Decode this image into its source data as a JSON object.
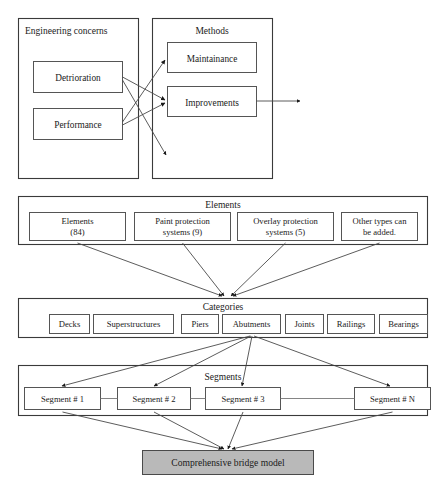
{
  "diagram": {
    "colors": {
      "frame_stroke": "#3a3a3a",
      "box_stroke": "#555555",
      "box_fill": "#ffffff",
      "shaded_fill": "#b9b9b9",
      "connector": "#4a4a4a",
      "text": "#1a1a1a",
      "background": "#ffffff"
    }
  },
  "panel_engineering": {
    "title": "Engineering concerns",
    "nodes": [
      {
        "label": "Detrioration"
      },
      {
        "label": "Performance"
      }
    ]
  },
  "panel_methods": {
    "title": "Methods",
    "nodes": [
      {
        "label": "Maintainance"
      },
      {
        "label": "Improvements"
      }
    ]
  },
  "panel_elements": {
    "title": "Elements",
    "nodes": [
      {
        "line1": "Elements",
        "line2": "(84)"
      },
      {
        "line1": "Paint protection",
        "line2": "systems (9)"
      },
      {
        "line1": "Overlay protection",
        "line2": "systems (5)"
      },
      {
        "line1": "Other types can",
        "line2": "be added."
      }
    ]
  },
  "panel_categories": {
    "title": "Categories",
    "nodes": [
      {
        "label": "Decks"
      },
      {
        "label": "Superstructures"
      },
      {
        "label": "Piers"
      },
      {
        "label": "Abutments"
      },
      {
        "label": "Joints"
      },
      {
        "label": "Railings"
      },
      {
        "label": "Bearings"
      }
    ]
  },
  "panel_segments": {
    "title": "Segments",
    "nodes": [
      {
        "label": "Segment # 1"
      },
      {
        "label": "Segment # 2"
      },
      {
        "label": "Segment # 3"
      },
      {
        "label": "Segment # N"
      }
    ]
  },
  "output_node": {
    "label": "Comprehensive bridge model"
  }
}
